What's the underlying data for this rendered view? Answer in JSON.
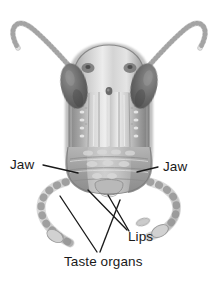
{
  "figure": {
    "view": "frontal",
    "style": "grayscale pencil/airbrush scientific illustration",
    "background_color": "#ffffff",
    "line_color": "#1a1a1a",
    "text_color": "#1a1a1a"
  },
  "labels": {
    "jaw_left": "Jaw",
    "jaw_right": "Jaw",
    "lips": "Lips",
    "taste_organs": "Taste organs"
  },
  "parts": [
    {
      "name": "antenna-left",
      "label": null,
      "shade": "#c9c9c9"
    },
    {
      "name": "antenna-right",
      "label": null,
      "shade": "#c9c9c9"
    },
    {
      "name": "compound-eye-left",
      "label": null,
      "shade": "#6e6e6e"
    },
    {
      "name": "compound-eye-right",
      "label": null,
      "shade": "#6e6e6e"
    },
    {
      "name": "ocellus",
      "label": null,
      "shade": "#555555"
    },
    {
      "name": "frons",
      "label": null,
      "shade": "#d2d2d2"
    },
    {
      "name": "clypeus",
      "label": null,
      "shade": "#b8b8b8"
    },
    {
      "name": "mandible-left",
      "label": "Jaw",
      "shade": "#9d9d9d"
    },
    {
      "name": "mandible-right",
      "label": "Jaw",
      "shade": "#9d9d9d"
    },
    {
      "name": "labrum-labium",
      "label": "Lips",
      "shade": "#a8a8a8"
    },
    {
      "name": "maxillary-palp-left",
      "label": "Taste organs",
      "shade": "#c4c4c4"
    },
    {
      "name": "maxillary-palp-right",
      "label": "Taste organs",
      "shade": "#c4c4c4"
    }
  ],
  "leader_lines": [
    {
      "name": "leader-jaw-left",
      "from": "Jaw",
      "to": "mandible-left"
    },
    {
      "name": "leader-jaw-right",
      "from": "Jaw",
      "to": "mandible-right"
    },
    {
      "name": "leader-lips-a",
      "from": "Lips",
      "to": "labrum"
    },
    {
      "name": "leader-lips-b",
      "from": "Lips",
      "to": "labium"
    },
    {
      "name": "leader-taste-a",
      "from": "Taste organs",
      "to": "maxillary-palp-left"
    },
    {
      "name": "leader-taste-b",
      "from": "Taste organs",
      "to": "maxillary-palp-right"
    }
  ],
  "palette": {
    "paper": "#ffffff",
    "ink": "#1a1a1a",
    "eye_dark": "#6e6e6e",
    "eye_darkest": "#4a4a4a",
    "head_light": "#e6e6e6",
    "head_mid": "#c0c0c0",
    "head_shadow": "#8f8f8f",
    "palp_light": "#d8d8d8"
  }
}
